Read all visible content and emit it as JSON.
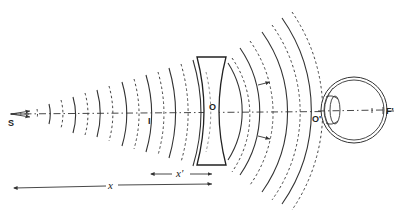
{
  "diagram": {
    "title": "",
    "labels": {
      "source": "S",
      "virtual_image": "I",
      "lens_center": "O",
      "eye_center": "O'",
      "focus": "F'",
      "image_distance": "x'",
      "object_distance": "x"
    },
    "components": [
      "point source",
      "incident wavefronts",
      "concave lens",
      "refracted wavefronts",
      "eye"
    ],
    "wavefront_style": [
      "solid",
      "dashed"
    ]
  }
}
